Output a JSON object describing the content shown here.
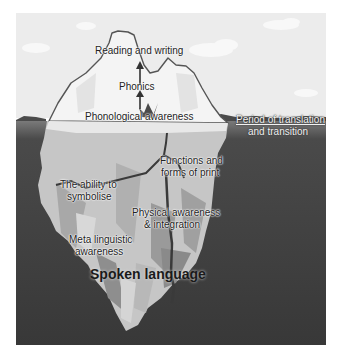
{
  "diagram": {
    "type": "iceberg",
    "colors": {
      "sky": "#ececec",
      "cloud": "#fafafa",
      "ice_above": "#f3f3f3",
      "ice_outline": "#555555",
      "ice_below_light": "#c8c8c8",
      "ice_below_mid": "#a9a9a9",
      "ice_below_dark": "#8c8c8c",
      "water": "#3b3b3b",
      "water_surface": "#6a6a6a",
      "crack": "#3a3a3a"
    },
    "above_water": {
      "top_label": "Reading and writing",
      "middle_label": "Phonics",
      "bottom_label": "Phonological awareness"
    },
    "waterline_label": {
      "line1": "Period of translation",
      "line2": "and transition"
    },
    "below_water": {
      "functions": {
        "line1": "Functions and",
        "line2": "forms of print"
      },
      "symbolise": {
        "line1": "The ability to",
        "line2": "symbolise"
      },
      "physical": {
        "line1": "Physical awareness",
        "line2": "& integration"
      },
      "meta": {
        "line1": "Meta linguistic",
        "line2": "awareness"
      },
      "base_label": "Spoken language"
    }
  }
}
